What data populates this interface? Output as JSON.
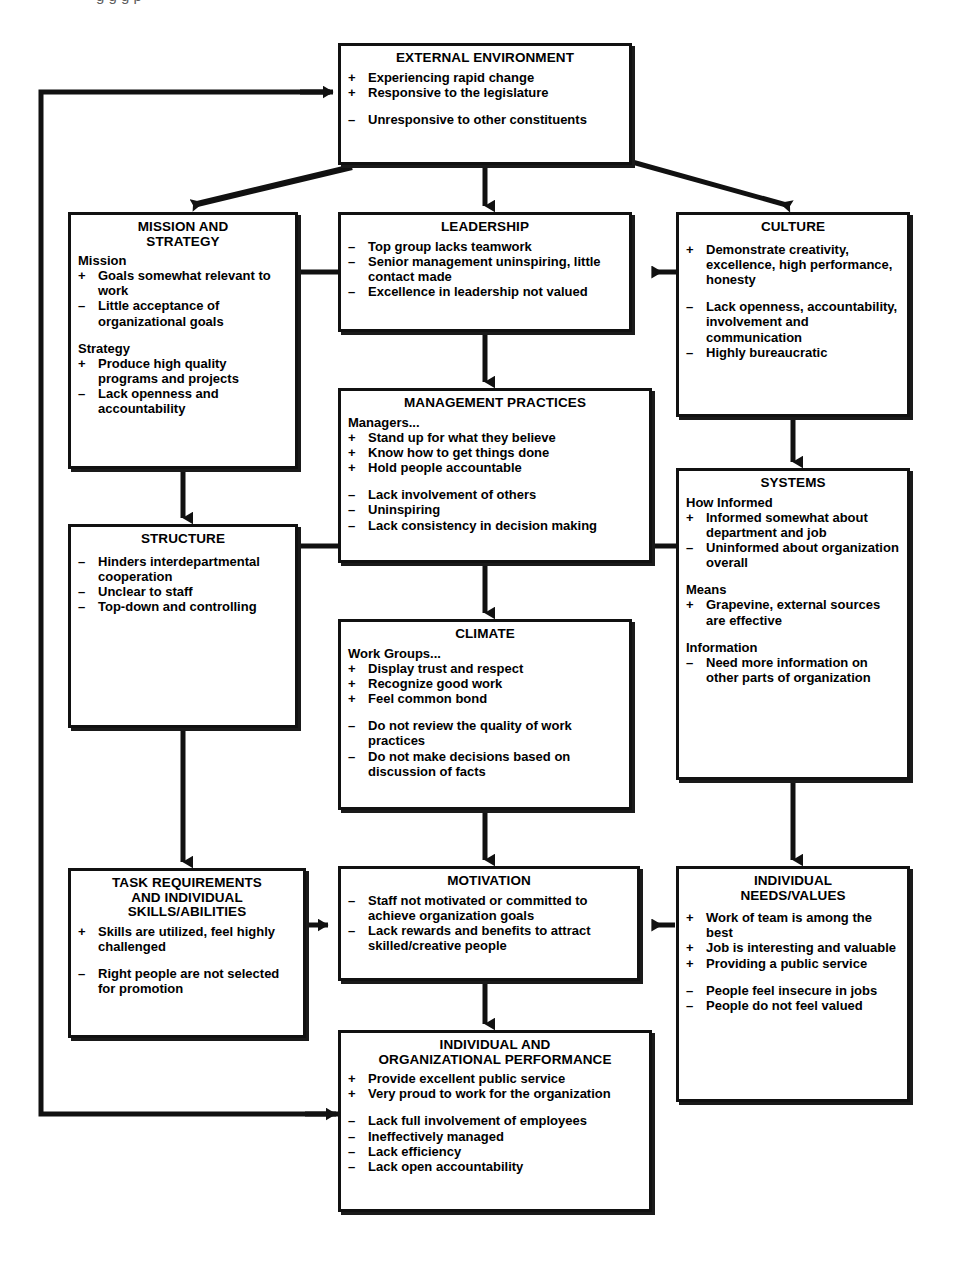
{
  "diagram": {
    "caption_partial": "g   g        g                  p",
    "legend": {
      "positive_sign": "+",
      "negative_sign": "–"
    },
    "colors": {
      "box_border": "#111111",
      "box_fill": "#ffffff",
      "connector": "#111111",
      "text": "#000000"
    }
  },
  "nodes": {
    "external_environment": {
      "title": "EXTERNAL ENVIRONMENT",
      "items": [
        {
          "sign": "+",
          "text": "Experiencing rapid change"
        },
        {
          "sign": "+",
          "text": "Responsive to the legislature"
        },
        {
          "sign": "–",
          "text": "Unresponsive to other constituents",
          "gap": true
        }
      ]
    },
    "mission_and_strategy": {
      "title": "MISSION AND\nSTRATEGY",
      "sections": [
        {
          "subhead": "Mission",
          "items": [
            {
              "sign": "+",
              "text": "Goals somewhat relevant to work"
            },
            {
              "sign": "–",
              "text": "Little acceptance of organizational goals"
            }
          ]
        },
        {
          "subhead": "Strategy",
          "items": [
            {
              "sign": "+",
              "text": "Produce high quality programs and projects"
            },
            {
              "sign": "–",
              "text": "Lack openness and accountability"
            }
          ]
        }
      ]
    },
    "leadership": {
      "title": "LEADERSHIP",
      "items": [
        {
          "sign": "–",
          "text": "Top group lacks teamwork"
        },
        {
          "sign": "–",
          "text": "Senior management uninspiring, little contact made"
        },
        {
          "sign": "–",
          "text": "Excellence in leadership not valued"
        }
      ]
    },
    "culture": {
      "title": "CULTURE",
      "items": [
        {
          "sign": "+",
          "text": "Demonstrate creativity, excellence, high performance, honesty"
        },
        {
          "sign": "–",
          "text": "Lack openness, accountability, involvement and communication",
          "gap": true
        },
        {
          "sign": "–",
          "text": "Highly bureaucratic"
        }
      ]
    },
    "management_practices": {
      "title": "MANAGEMENT PRACTICES",
      "subhead": "Managers...",
      "items": [
        {
          "sign": "+",
          "text": "Stand up for what they believe"
        },
        {
          "sign": "+",
          "text": "Know how to get things done"
        },
        {
          "sign": "+",
          "text": "Hold people accountable"
        },
        {
          "sign": "–",
          "text": "Lack involvement of others",
          "gap": true
        },
        {
          "sign": "–",
          "text": "Uninspiring"
        },
        {
          "sign": "–",
          "text": "Lack consistency in decision making"
        }
      ]
    },
    "structure": {
      "title": "STRUCTURE",
      "items": [
        {
          "sign": "–",
          "text": "Hinders interdepartmental cooperation"
        },
        {
          "sign": "–",
          "text": "Unclear to staff"
        },
        {
          "sign": "–",
          "text": "Top-down and controlling"
        }
      ]
    },
    "systems": {
      "title": "SYSTEMS",
      "sections": [
        {
          "subhead": "How Informed",
          "items": [
            {
              "sign": "+",
              "text": "Informed somewhat about department and job"
            },
            {
              "sign": "–",
              "text": "Uninformed about organization overall"
            }
          ]
        },
        {
          "subhead": "Means",
          "items": [
            {
              "sign": "+",
              "text": "Grapevine, external sources are effective"
            }
          ]
        },
        {
          "subhead": "Information",
          "items": [
            {
              "sign": "–",
              "text": "Need more information on other parts of organization"
            }
          ]
        }
      ]
    },
    "climate": {
      "title": "CLIMATE",
      "subhead": "Work Groups...",
      "items": [
        {
          "sign": "+",
          "text": "Display trust and respect"
        },
        {
          "sign": "+",
          "text": "Recognize good work"
        },
        {
          "sign": "+",
          "text": "Feel common bond"
        },
        {
          "sign": "–",
          "text": "Do not review the quality of work practices",
          "gap": true
        },
        {
          "sign": "–",
          "text": "Do not make decisions based on discussion of facts"
        }
      ]
    },
    "task_requirements": {
      "title": "TASK REQUIREMENTS\nAND INDIVIDUAL\nSKILLS/ABILITIES",
      "items": [
        {
          "sign": "+",
          "text": "Skills are utilized, feel highly challenged"
        },
        {
          "sign": "–",
          "text": "Right people are not selected for promotion",
          "gap": true
        }
      ]
    },
    "motivation": {
      "title": "MOTIVATION",
      "items": [
        {
          "sign": "–",
          "text": "Staff not motivated or committed to achieve organization goals"
        },
        {
          "sign": "–",
          "text": "Lack rewards and benefits to attract skilled/creative people"
        }
      ]
    },
    "individual_needs_values": {
      "title": "INDIVIDUAL\nNEEDS/VALUES",
      "items": [
        {
          "sign": "+",
          "text": "Work of team is among the best"
        },
        {
          "sign": "+",
          "text": "Job is interesting and valuable"
        },
        {
          "sign": "+",
          "text": "Providing a public service"
        },
        {
          "sign": "–",
          "text": "People feel insecure in jobs",
          "gap": true
        },
        {
          "sign": "–",
          "text": "People do not feel valued"
        }
      ]
    },
    "performance": {
      "title": "INDIVIDUAL AND\nORGANIZATIONAL PERFORMANCE",
      "items": [
        {
          "sign": "+",
          "text": "Provide excellent public service"
        },
        {
          "sign": "+",
          "text": "Very proud to work for the organization"
        },
        {
          "sign": "–",
          "text": "Lack full involvement of employees",
          "gap": true
        },
        {
          "sign": "–",
          "text": "Ineffectively managed"
        },
        {
          "sign": "–",
          "text": "Lack efficiency"
        },
        {
          "sign": "–",
          "text": "Lack open accountability"
        }
      ]
    }
  },
  "connectors": [
    {
      "from": "external_environment",
      "to": "mission_and_strategy",
      "style": "arrow"
    },
    {
      "from": "external_environment",
      "to": "leadership",
      "style": "arrow"
    },
    {
      "from": "external_environment",
      "to": "culture",
      "style": "arrow"
    },
    {
      "from": "mission_and_strategy",
      "to": "leadership",
      "style": "line"
    },
    {
      "from": "culture",
      "to": "leadership",
      "style": "arrow"
    },
    {
      "from": "leadership",
      "to": "management_practices",
      "style": "arrow"
    },
    {
      "from": "mission_and_strategy",
      "to": "structure",
      "style": "arrow"
    },
    {
      "from": "culture",
      "to": "systems",
      "style": "arrow"
    },
    {
      "from": "structure",
      "to": "management_practices",
      "style": "line"
    },
    {
      "from": "management_practices",
      "to": "systems",
      "style": "line"
    },
    {
      "from": "management_practices",
      "to": "climate",
      "style": "arrow"
    },
    {
      "from": "structure",
      "to": "task_requirements",
      "style": "arrow"
    },
    {
      "from": "systems",
      "to": "individual_needs_values",
      "style": "arrow"
    },
    {
      "from": "climate",
      "to": "motivation",
      "style": "arrow"
    },
    {
      "from": "task_requirements",
      "to": "motivation",
      "style": "arrow"
    },
    {
      "from": "individual_needs_values",
      "to": "motivation",
      "style": "arrow"
    },
    {
      "from": "motivation",
      "to": "performance",
      "style": "arrow"
    },
    {
      "from": "performance",
      "to": "external_environment",
      "style": "feedback-loop"
    }
  ]
}
